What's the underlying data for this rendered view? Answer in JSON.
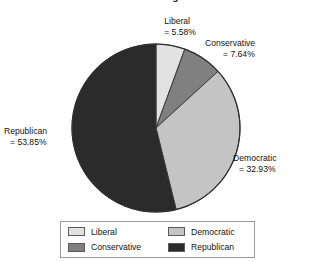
{
  "chart_data": {
    "type": "pie",
    "title": "Percentage",
    "xlabel": "",
    "ylabel": "",
    "legend_position": "bottom",
    "grid": false,
    "start_angle_deg": 0,
    "direction": "clockwise",
    "categories": [
      "Liberal",
      "Conservative",
      "Democratic",
      "Republican"
    ],
    "values": [
      5.58,
      7.64,
      32.93,
      53.85
    ],
    "units": "%",
    "colors": [
      "#e2e2e2",
      "#808080",
      "#c4c4c4",
      "#2b2b2b"
    ],
    "slices": [
      {
        "label": "Liberal",
        "value": 5.58,
        "value_text": "= 5.58%",
        "color": "#e2e2e2"
      },
      {
        "label": "Conservative",
        "value": 7.64,
        "value_text": "= 7.64%",
        "color": "#808080"
      },
      {
        "label": "Democratic",
        "value": 32.93,
        "value_text": "= 32.93%",
        "color": "#c4c4c4"
      },
      {
        "label": "Republican",
        "value": 53.85,
        "value_text": "= 53.85%",
        "color": "#2b2b2b"
      }
    ],
    "annotations": [
      "Liberal = 5.58%",
      "Conservative = 7.64%",
      "Democratic = 32.93%",
      "Republican = 53.85%"
    ]
  },
  "labels": {
    "liberal": {
      "name": "Liberal",
      "value": "= 5.58%"
    },
    "conservative": {
      "name": "Conservative",
      "value": "= 7.64%"
    },
    "democratic": {
      "name": "Democratic",
      "value": "= 32.93%"
    },
    "republican": {
      "name": "Republican",
      "value": "= 53.85%"
    }
  },
  "legend": {
    "entries": [
      {
        "label": "Liberal",
        "color": "#e2e2e2"
      },
      {
        "label": "Democratic",
        "color": "#c4c4c4"
      },
      {
        "label": "Conservative",
        "color": "#808080"
      },
      {
        "label": "Republican",
        "color": "#2b2b2b"
      }
    ]
  }
}
